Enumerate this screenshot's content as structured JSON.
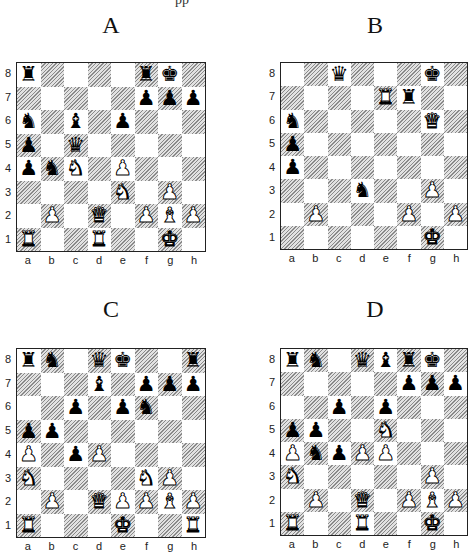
{
  "header_fragment": "pp",
  "files": [
    "a",
    "b",
    "c",
    "d",
    "e",
    "f",
    "g",
    "h"
  ],
  "ranks": [
    "8",
    "7",
    "6",
    "5",
    "4",
    "3",
    "2",
    "1"
  ],
  "diagrams": [
    {
      "label": "A",
      "pieces": {
        "a8": "bR",
        "f8": "bR",
        "g8": "bK",
        "f7": "bP",
        "g7": "bP",
        "h7": "bP",
        "a6": "bN",
        "c6": "bB",
        "e6": "bP",
        "a5": "bP",
        "c5": "bQ",
        "a4": "bP",
        "b4": "bN",
        "c4": "wN",
        "e4": "wP",
        "e3": "wN",
        "g3": "wP",
        "b2": "wP",
        "d2": "wQ",
        "f2": "wP",
        "g2": "wB",
        "h2": "wP",
        "a1": "wR",
        "d1": "wR",
        "g1": "wK"
      }
    },
    {
      "label": "B",
      "pieces": {
        "c8": "bQ",
        "g8": "bK",
        "e7": "wR",
        "f7": "bR",
        "a6": "bN",
        "g6": "wQ",
        "a5": "bP",
        "a4": "bP",
        "d3": "bN",
        "g3": "wP",
        "b2": "wP",
        "f2": "wP",
        "h2": "wP",
        "g1": "wK"
      }
    },
    {
      "label": "C",
      "pieces": {
        "a8": "bR",
        "b8": "bN",
        "d8": "bQ",
        "e8": "bK",
        "h8": "bR",
        "d7": "bB",
        "f7": "bP",
        "g7": "bP",
        "h7": "bP",
        "c6": "bP",
        "e6": "bP",
        "f6": "bN",
        "a5": "bP",
        "b5": "bP",
        "a4": "wP",
        "c4": "bP",
        "d4": "wP",
        "a3": "wN",
        "f3": "wN",
        "g3": "wP",
        "b2": "wP",
        "d2": "wQ",
        "e2": "wP",
        "f2": "wP",
        "g2": "wB",
        "h2": "wP",
        "a1": "wR",
        "e1": "wK",
        "h1": "wR"
      }
    },
    {
      "label": "D",
      "pieces": {
        "a8": "bR",
        "b8": "bN",
        "d8": "bQ",
        "e8": "bB",
        "f8": "bR",
        "g8": "bK",
        "f7": "bP",
        "g7": "bP",
        "h7": "bP",
        "c6": "bP",
        "e6": "bP",
        "a5": "bP",
        "b5": "bP",
        "e5": "wN",
        "a4": "wP",
        "b4": "bN",
        "c4": "bP",
        "d4": "wP",
        "e4": "wP",
        "a3": "wN",
        "g3": "wP",
        "b2": "wP",
        "d2": "wQ",
        "f2": "wP",
        "g2": "wB",
        "h2": "wP",
        "a1": "wR",
        "d1": "wR",
        "g1": "wK"
      }
    }
  ],
  "glyphs": {
    "K": "♚",
    "Q": "♛",
    "R": "♜",
    "B": "♝",
    "N": "♞",
    "P": "♟"
  },
  "colors": {
    "dark_hatch": "#8a8a8a",
    "light_square": "#ffffff",
    "border": "#222222"
  }
}
